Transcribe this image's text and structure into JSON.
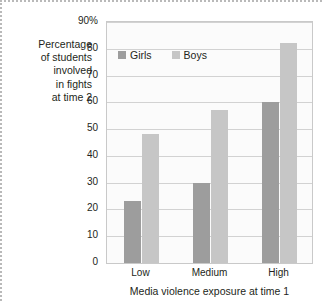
{
  "chart_data": {
    "type": "bar",
    "title": "",
    "subtitle": "",
    "categories": [
      "Low",
      "Medium",
      "High"
    ],
    "series": [
      {
        "name": "Girls",
        "values": [
          23,
          30,
          60
        ],
        "color": "#9d9d9d"
      },
      {
        "name": "Boys",
        "values": [
          48,
          57,
          82
        ],
        "color": "#c6c6c6"
      }
    ],
    "xlabel": "Media violence exposure at time 1",
    "ylabel": "Percentage of students involved in fights at time 2",
    "ylabel_lines": [
      "Percentage",
      "of students",
      "involved",
      "in fights",
      "at time 2"
    ],
    "ylim": [
      0,
      90
    ],
    "ytick_labels": [
      "90%",
      "80",
      "70",
      "60",
      "50",
      "40",
      "30",
      "20",
      "10",
      "0"
    ],
    "ytick_values": [
      90,
      80,
      70,
      60,
      50,
      40,
      30,
      20,
      10,
      0
    ],
    "grid": true,
    "legend_position": "top-left-inside",
    "legend_entries": [
      "Girls",
      "Boys"
    ]
  },
  "axis": {
    "y_label_text": "Percentage\nof students\ninvolved\nin fights\nat time 2",
    "x_title": "Media violence exposure at time 1"
  },
  "legend": {
    "girls_label": "Girls",
    "boys_label": "Boys"
  },
  "ticks": {
    "y": [
      "90%",
      "80",
      "70",
      "60",
      "50",
      "40",
      "30",
      "20",
      "10",
      "0"
    ],
    "x": [
      "Low",
      "Medium",
      "High"
    ]
  },
  "colors": {
    "girls": "#9d9d9d",
    "boys": "#c6c6c6",
    "grid": "#d2d2d2",
    "frame": "#c9c9c9",
    "plot_bg": "#fbfbfb",
    "text": "#231f20"
  }
}
